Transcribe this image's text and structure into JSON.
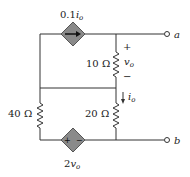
{
  "circuit": {
    "current_source": {
      "coef": "0.1",
      "var": "i",
      "sub": "o"
    },
    "voltage_source": {
      "coef": "2",
      "var": "v",
      "sub": "o",
      "plus": "+",
      "minus": "−"
    },
    "r10": {
      "label": "10 Ω"
    },
    "r20": {
      "label": "20 Ω"
    },
    "r40": {
      "label": "40 Ω"
    },
    "vo": {
      "var": "v",
      "sub": "o",
      "plus": "+",
      "minus": "−"
    },
    "io": {
      "var": "i",
      "sub": "o"
    },
    "terminal_a": "a",
    "terminal_b": "b"
  }
}
